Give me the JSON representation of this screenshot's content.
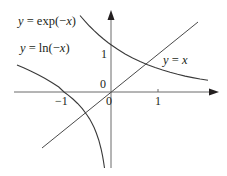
{
  "diagram": {
    "type": "function-graph",
    "colors": {
      "background": "#ffffff",
      "ink": "#231f20",
      "curve": "#3a3a3a"
    },
    "axes": {
      "x_arrow": true,
      "y_arrow": true,
      "origin_label_upper": "0",
      "origin_label_lower": "0"
    },
    "ticks": {
      "x_neg1": "−1",
      "x_pos1": "1",
      "y_pos1": "1"
    },
    "curves": [
      {
        "id": "exp-neg-x",
        "label": "y = exp(−x)",
        "var": "y",
        "eq": " = exp(−",
        "arg": "x",
        "close": ")"
      },
      {
        "id": "ln-neg-x",
        "label": "y = ln(−x)",
        "var": "y",
        "eq": " = ln(−",
        "arg": "x",
        "close": ")"
      },
      {
        "id": "identity",
        "label": "y = x",
        "var": "y",
        "eq": " = ",
        "arg": "x",
        "close": ""
      }
    ]
  }
}
